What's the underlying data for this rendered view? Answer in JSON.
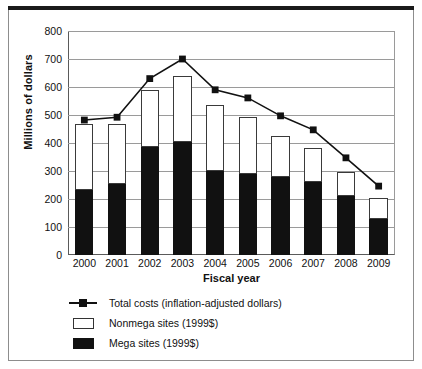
{
  "chart_data": {
    "type": "bar",
    "title": "",
    "xlabel": "Fiscal year",
    "ylabel": "Millions of dollars",
    "categories": [
      "2000",
      "2001",
      "2002",
      "2003",
      "2004",
      "2005",
      "2006",
      "2007",
      "2008",
      "2009"
    ],
    "ylim": [
      0,
      800
    ],
    "yticks": [
      0,
      100,
      200,
      300,
      400,
      500,
      600,
      700,
      800
    ],
    "grid": true,
    "legend_position": "below-plot-left",
    "stacked": true,
    "series": [
      {
        "name": "Mega sites (1999$)",
        "kind": "bar-segment",
        "color": "#111111",
        "values": [
          232,
          253,
          386,
          404,
          300,
          289,
          279,
          261,
          211,
          129
        ]
      },
      {
        "name": "Nonmega sites (1999$)",
        "kind": "bar-segment",
        "color": "#ffffff",
        "values": [
          236,
          215,
          202,
          234,
          236,
          204,
          146,
          121,
          85,
          75
        ]
      },
      {
        "name": "Total costs (inflation-adjusted dollars)",
        "kind": "line",
        "color": "#111111",
        "marker": "square",
        "values": [
          482,
          492,
          630,
          700,
          590,
          561,
          497,
          447,
          347,
          246
        ]
      }
    ],
    "stack_totals": [
      468,
      468,
      588,
      638,
      536,
      493,
      425,
      382,
      296,
      204
    ]
  },
  "legend": {
    "items": [
      {
        "key": "line-marker",
        "label": "Total costs (inflation-adjusted dollars)"
      },
      {
        "key": "swatch-open",
        "label": "Nonmega sites (1999$)"
      },
      {
        "key": "swatch-solid",
        "label": "Mega sites (1999$)"
      }
    ]
  }
}
